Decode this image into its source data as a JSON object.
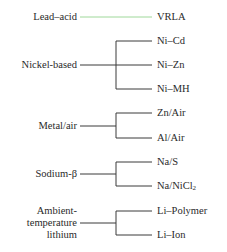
{
  "diagram": {
    "colors": {
      "line": "#3a3a3a",
      "highlight_line": "#9fd89a",
      "text": "#2a2a2a"
    },
    "groups": [
      {
        "name": "Lead–acid",
        "children": [
          "VRLA"
        ]
      },
      {
        "name": "Nickel-based",
        "children": [
          "Ni–Cd",
          "Ni–Zn",
          "Ni–MH"
        ]
      },
      {
        "name": "Metal/air",
        "children": [
          "Zn/Air",
          "Al/Air"
        ]
      },
      {
        "name": "Sodium-β",
        "children": [
          "Na/S",
          "Na/NiCl"
        ]
      },
      {
        "name_lines": [
          "Ambient-",
          "temperature",
          "lithium"
        ],
        "children": [
          "Li–Polymer",
          "Li–Ion"
        ]
      }
    ],
    "subscripts": {
      "na_nicl": "2"
    }
  }
}
